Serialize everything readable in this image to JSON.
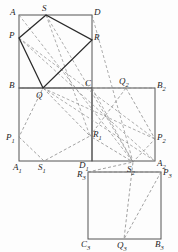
{
  "figure": {
    "canvas": {
      "width": 178,
      "height": 252
    },
    "colors": {
      "solid_stroke": "#2b2b2b",
      "square_stroke": "#555555",
      "dashed_stroke": "#8a8a8a",
      "background": "#fdfdfd",
      "label_color": "#1d1d1d"
    },
    "squares": [
      {
        "name": "square-ABCD",
        "x": 19,
        "y": 15,
        "size": 73,
        "corners": [
          "A",
          "D",
          "C",
          "B"
        ]
      },
      {
        "name": "square-A1B1B2A2",
        "x": 19,
        "y": 88,
        "size": 73,
        "corners": [
          "B",
          "C",
          "D1",
          "A1"
        ]
      },
      {
        "name": "square-middle-right",
        "x": 92,
        "y": 88,
        "size": 73,
        "corners": [
          "C",
          "B2",
          "A2",
          "D1"
        ]
      },
      {
        "name": "square-bottom-right",
        "x": 88,
        "y": 166,
        "size": 73,
        "corners": [
          "R3",
          "P3",
          "B3",
          "C3"
        ]
      }
    ],
    "points": [
      {
        "id": "A",
        "label": "A",
        "x": 19,
        "y": 15,
        "lx": 10,
        "ly": 8,
        "sub": ""
      },
      {
        "id": "S",
        "label": "S",
        "x": 46,
        "y": 15,
        "lx": 42,
        "ly": 4,
        "sub": ""
      },
      {
        "id": "D",
        "label": "D",
        "x": 92,
        "y": 15,
        "lx": 94,
        "ly": 8,
        "sub": ""
      },
      {
        "id": "P",
        "label": "P",
        "x": 19,
        "y": 38,
        "lx": 10,
        "ly": 31,
        "sub": ""
      },
      {
        "id": "R",
        "label": "R",
        "x": 92,
        "y": 40,
        "lx": 94,
        "ly": 33,
        "sub": ""
      },
      {
        "id": "B",
        "label": "B",
        "x": 19,
        "y": 88,
        "lx": 10,
        "ly": 81,
        "sub": ""
      },
      {
        "id": "Q",
        "label": "Q",
        "x": 43,
        "y": 88,
        "lx": 37,
        "ly": 91,
        "sub": ""
      },
      {
        "id": "C",
        "label": "C",
        "x": 92,
        "y": 88,
        "lx": 86,
        "ly": 80,
        "sub": ""
      },
      {
        "id": "Q2",
        "label": "Q",
        "x": 126,
        "y": 88,
        "lx": 120,
        "ly": 78,
        "sub": "2"
      },
      {
        "id": "B2",
        "label": "B",
        "x": 155,
        "y": 88,
        "lx": 157,
        "ly": 81,
        "sub": "2"
      },
      {
        "id": "P1",
        "label": "P",
        "x": 19,
        "y": 137,
        "lx": 7,
        "ly": 134,
        "sub": "1"
      },
      {
        "id": "R1",
        "label": "R",
        "x": 90,
        "y": 136,
        "lx": 93,
        "ly": 131,
        "sub": "1"
      },
      {
        "id": "P2",
        "label": "P",
        "x": 155,
        "y": 139,
        "lx": 157,
        "ly": 134,
        "sub": "2"
      },
      {
        "id": "A1",
        "label": "A",
        "x": 19,
        "y": 161,
        "lx": 13,
        "ly": 163,
        "sub": "1"
      },
      {
        "id": "S1",
        "label": "S",
        "x": 44,
        "y": 161,
        "lx": 38,
        "ly": 163,
        "sub": "1"
      },
      {
        "id": "D1",
        "label": "D",
        "x": 92,
        "y": 161,
        "lx": 80,
        "ly": 161,
        "sub": "1"
      },
      {
        "id": "S2",
        "label": "S",
        "x": 133,
        "y": 162,
        "lx": 128,
        "ly": 166,
        "sub": "2"
      },
      {
        "id": "A2",
        "label": "A",
        "x": 155,
        "y": 161,
        "lx": 157,
        "ly": 160,
        "sub": "2"
      },
      {
        "id": "R3",
        "label": "R",
        "x": 88,
        "y": 172,
        "lx": 78,
        "ly": 170,
        "sub": "3"
      },
      {
        "id": "P3",
        "label": "P",
        "x": 161,
        "y": 172,
        "lx": 163,
        "ly": 168,
        "sub": "3"
      },
      {
        "id": "C3",
        "label": "C",
        "x": 88,
        "y": 239,
        "lx": 82,
        "ly": 240,
        "sub": "3"
      },
      {
        "id": "Q3",
        "label": "Q",
        "x": 124,
        "y": 239,
        "lx": 118,
        "ly": 241,
        "sub": "3"
      },
      {
        "id": "B3",
        "label": "B",
        "x": 161,
        "y": 239,
        "lx": 156,
        "ly": 240,
        "sub": "3"
      }
    ],
    "solid_polygons": [
      {
        "name": "quad-PSRQ",
        "vertices": [
          "P",
          "S",
          "R",
          "Q"
        ],
        "closed": true
      }
    ],
    "dashed_polygons": [
      {
        "name": "quad-P1S1R1Q1",
        "vertices": [
          "P1",
          "S1",
          "R1",
          "Q"
        ],
        "closed": true
      },
      {
        "name": "quad-Q2P2S2R1",
        "vertices": [
          "Q2",
          "P2",
          "S2",
          "R1"
        ],
        "closed": true
      },
      {
        "name": "quad-R3P3Q3S2",
        "vertices": [
          "R3",
          "P3",
          "Q3",
          "S2"
        ],
        "closed": true
      }
    ],
    "dashed_rays": [
      {
        "name": "ray-A-to-S2",
        "from": "A",
        "to": "S2"
      },
      {
        "name": "ray-P-to-A2",
        "from": "P",
        "to": "A2"
      },
      {
        "name": "ray-P-to-P2",
        "from": "P",
        "to": "P2"
      },
      {
        "name": "ray-S-to-R1",
        "from": "S",
        "to": "R1"
      },
      {
        "name": "ray-D-to-S2",
        "from": "D",
        "to": "S2"
      },
      {
        "name": "ray-C-to-S2",
        "from": "C",
        "to": "S2"
      },
      {
        "name": "ray-Q-to-P2",
        "from": "Q",
        "to": "P2"
      },
      {
        "name": "ray-B-to-B2",
        "from": "B",
        "to": "B2"
      }
    ],
    "stroke_widths": {
      "square": 1.0,
      "solid": 1.2,
      "dashed": 0.7
    },
    "dash_pattern": "3,2.2"
  }
}
